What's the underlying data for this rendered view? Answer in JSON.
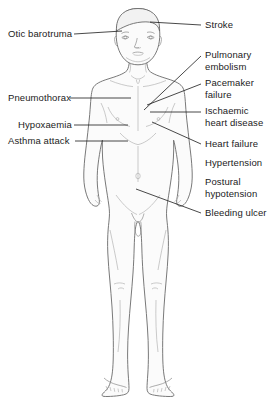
{
  "diagram": {
    "line_color": "#555555",
    "leader_color": "#1b1b1b",
    "body_fill": "#fbfbfb",
    "text_color": "#1b1b1b",
    "background": "#ffffff"
  },
  "labels_left": [
    {
      "id": "otic-barotruma",
      "lines": [
        "Otic barotruma"
      ],
      "x": 8,
      "y": 28,
      "leader": {
        "x1": 74,
        "y1": 34,
        "x2": 122,
        "y2": 31
      }
    },
    {
      "id": "pneumothorax",
      "lines": [
        "Pneumothorax"
      ],
      "x": 8,
      "y": 92,
      "leader": {
        "x1": 70,
        "y1": 98,
        "x2": 131,
        "y2": 98
      }
    },
    {
      "id": "hypoxaemia",
      "lines": [
        "Hypoxaemia"
      ],
      "x": 18,
      "y": 119,
      "leader": {
        "x1": 74,
        "y1": 125,
        "x2": 128,
        "y2": 125
      }
    },
    {
      "id": "asthma-attack",
      "lines": [
        "Asthma attack"
      ],
      "x": 8,
      "y": 135,
      "leader": {
        "x1": 75,
        "y1": 141,
        "x2": 128,
        "y2": 141
      }
    }
  ],
  "labels_right": [
    {
      "id": "stroke",
      "lines": [
        "Stroke"
      ],
      "x": 205,
      "y": 19,
      "leader": {
        "x1": 201,
        "y1": 25,
        "x2": 150,
        "y2": 22
      }
    },
    {
      "id": "pulmonary-embolism",
      "lines": [
        "Pulmonary",
        "embolism"
      ],
      "x": 205,
      "y": 49,
      "leader": {
        "x1": 201,
        "y1": 56,
        "x2": 144,
        "y2": 110
      }
    },
    {
      "id": "pacemaker-failure",
      "lines": [
        "Pacemaker",
        "failure"
      ],
      "x": 205,
      "y": 77,
      "leader": {
        "x1": 201,
        "y1": 84,
        "x2": 147,
        "y2": 105
      }
    },
    {
      "id": "ischaemic-heart-disease",
      "lines": [
        "Ischaemic",
        "heart disease"
      ],
      "x": 205,
      "y": 105,
      "leader": {
        "x1": 201,
        "y1": 112,
        "x2": 150,
        "y2": 112
      }
    },
    {
      "id": "heart-failure",
      "lines": [
        "Heart failure"
      ],
      "x": 205,
      "y": 138,
      "leader": {
        "x1": 201,
        "y1": 144,
        "x2": 152,
        "y2": 122
      }
    },
    {
      "id": "hypertension",
      "lines": [
        "Hypertension"
      ],
      "x": 205,
      "y": 157,
      "leader": null
    },
    {
      "id": "postural-hypotension",
      "lines": [
        "Postural",
        "hypotension"
      ],
      "x": 205,
      "y": 176,
      "leader": null
    },
    {
      "id": "bleeding-ulcer",
      "lines": [
        "Bleeding ulcer"
      ],
      "x": 205,
      "y": 207,
      "leader": {
        "x1": 201,
        "y1": 213,
        "x2": 136,
        "y2": 189
      }
    }
  ]
}
